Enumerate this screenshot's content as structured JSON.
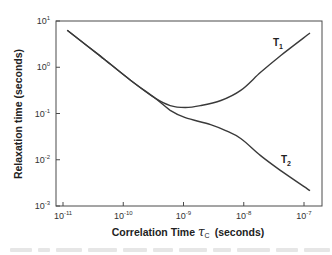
{
  "chart_data": {
    "type": "line",
    "title": "",
    "xlabel": "Correlation Time τc (seconds)",
    "xlabel_main": "Correlation Time ",
    "xlabel_symbol": "τ",
    "xlabel_sub": "C",
    "xlabel_unit": "(seconds)",
    "ylabel": "Relaxation time  (seconds)",
    "x_scale": "log",
    "y_scale": "log",
    "xlim": [
      1e-11,
      1e-07
    ],
    "ylim": [
      0.001,
      10
    ],
    "x_ticks": [
      {
        "base": "10",
        "exp": "-11",
        "log": -11
      },
      {
        "base": "10",
        "exp": "-10",
        "log": -10
      },
      {
        "base": "10",
        "exp": "-9",
        "log": -9
      },
      {
        "base": "10",
        "exp": "-8",
        "log": -8
      },
      {
        "base": "10",
        "exp": "-7",
        "log": -7
      }
    ],
    "y_ticks": [
      {
        "base": "10",
        "exp": "1",
        "log": 1
      },
      {
        "base": "10",
        "exp": "0",
        "log": 0
      },
      {
        "base": "10",
        "exp": "-1",
        "log": -1
      },
      {
        "base": "10",
        "exp": "-2",
        "log": -2
      },
      {
        "base": "10",
        "exp": "-3",
        "log": -3
      }
    ],
    "grid": false,
    "legend": "inline labels at curve ends",
    "series": [
      {
        "name": "T1",
        "label_main": "T",
        "label_sub": "1",
        "log_x": [
          -10.93,
          -10.38,
          -9.88,
          -9.47,
          -9.22,
          -8.97,
          -8.72,
          -8.38,
          -8.05,
          -7.72,
          -7.38,
          -6.9
        ],
        "log_y": [
          0.8,
          0.24,
          -0.28,
          -0.67,
          -0.83,
          -0.87,
          -0.83,
          -0.72,
          -0.5,
          -0.11,
          0.26,
          0.74
        ],
        "x": [
          1.2e-11,
          4.2e-11,
          1.3e-10,
          3.4e-10,
          6e-10,
          1.07e-09,
          1.9e-09,
          4.2e-09,
          8.9e-09,
          1.9e-08,
          4.2e-08,
          1.26e-07
        ],
        "y": [
          6.3,
          1.7,
          0.52,
          0.21,
          0.15,
          0.135,
          0.15,
          0.19,
          0.32,
          0.78,
          1.8,
          5.5
        ]
      },
      {
        "name": "T2",
        "label_main": "T",
        "label_sub": "2",
        "log_x": [
          -10.93,
          -10.38,
          -9.88,
          -9.47,
          -9.22,
          -8.97,
          -8.55,
          -8.3,
          -8.05,
          -7.72,
          -7.38,
          -6.9
        ],
        "log_y": [
          0.8,
          0.24,
          -0.28,
          -0.67,
          -0.93,
          -1.09,
          -1.24,
          -1.37,
          -1.54,
          -1.91,
          -2.24,
          -2.67
        ],
        "x": [
          1.2e-11,
          4.2e-11,
          1.3e-10,
          3.4e-10,
          6e-10,
          1.07e-09,
          2.8e-09,
          5e-09,
          8.9e-09,
          1.9e-08,
          4.2e-08,
          1.26e-07
        ],
        "y": [
          6.3,
          1.7,
          0.52,
          0.21,
          0.12,
          0.081,
          0.058,
          0.043,
          0.029,
          0.012,
          0.0058,
          0.0021
        ]
      }
    ]
  },
  "style": {
    "line_color": "#3a3a3a",
    "frame_color": "#4a4a4a",
    "caption_color": "#e6e6e6"
  }
}
